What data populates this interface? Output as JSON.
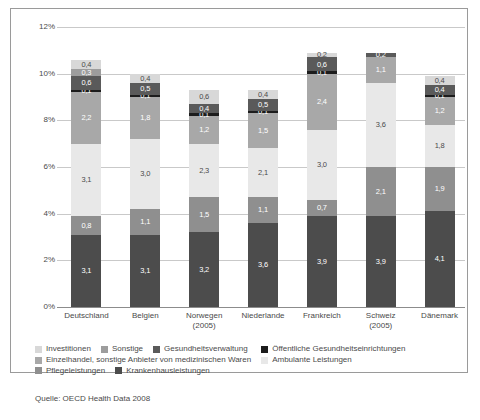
{
  "chart_data": {
    "type": "bar",
    "subtype": "stacked-bar",
    "title": "",
    "xlabel": "",
    "ylabel": "",
    "ylim": [
      0,
      12
    ],
    "ytick_labels": [
      "0%",
      "2%",
      "4%",
      "6%",
      "8%",
      "10%",
      "12%"
    ],
    "ytick_values": [
      0,
      2,
      4,
      6,
      8,
      10,
      12
    ],
    "grid": true,
    "legend_position": "bottom",
    "value_format": "comma-decimal",
    "categories": [
      "Deutschland",
      "Belgien",
      "Norwegen",
      "Niederlande",
      "Frankreich",
      "Schweiz",
      "Dänemark"
    ],
    "category_sublabels": [
      "",
      "",
      "(2005)",
      "",
      "",
      "(2005)",
      ""
    ],
    "series": [
      {
        "name": "Krankenhausleistungen",
        "color": "#4c4c4c",
        "values": [
          3.1,
          3.1,
          3.2,
          3.6,
          3.9,
          3.9,
          4.1
        ],
        "labels": [
          "3,1",
          "3,1",
          "3,2",
          "3,6",
          "3,9",
          "3,9",
          "4,1"
        ],
        "label_color": "#ffffff"
      },
      {
        "name": "Pflegeleistungen",
        "color": "#8f8f8f",
        "values": [
          0.8,
          1.1,
          1.5,
          1.1,
          0.7,
          2.1,
          1.9
        ],
        "labels": [
          "0,8",
          "1,1",
          "1,5",
          "1,1",
          "0,7",
          "2,1",
          "1,9"
        ],
        "label_color": "#ffffff"
      },
      {
        "name": "Ambulante Leistungen",
        "color": "#e8e8e8",
        "values": [
          3.1,
          3.0,
          2.3,
          2.1,
          3.0,
          3.6,
          1.8
        ],
        "labels": [
          "3,1",
          "3,0",
          "2,3",
          "2,1",
          "3,0",
          "3,6",
          "1,8"
        ],
        "label_color": "#4a4a4a"
      },
      {
        "name": "Einzelhandel, sonstige Anbieter von medizinischen Waren",
        "color": "#a8a8a8",
        "values": [
          2.2,
          1.8,
          1.2,
          1.5,
          2.4,
          1.1,
          1.2
        ],
        "labels": [
          "2,2",
          "1,8",
          "1,2",
          "1,5",
          "2,4",
          "1,1",
          "1,2"
        ],
        "label_color": "#ffffff"
      },
      {
        "name": "Öffentliche Gesundheitseinrichtungen",
        "color": "#1c1c1c",
        "values": [
          0.1,
          0.1,
          0.1,
          0.1,
          0.1,
          0.0,
          0.1
        ],
        "labels": [
          "0,1",
          "0,1",
          "0,1",
          "0,1",
          "0,1",
          "",
          "0,1"
        ],
        "label_color": "#ffffff"
      },
      {
        "name": "Gesundheitsverwaltung",
        "color": "#5a5a5a",
        "values": [
          0.6,
          0.5,
          0.4,
          0.5,
          0.6,
          0.2,
          0.4
        ],
        "labels": [
          "0,6",
          "0,5",
          "0,4",
          "0,5",
          "0,6",
          "0,2",
          "0,4"
        ],
        "label_color": "#ffffff"
      },
      {
        "name": "Sonstige",
        "color": "#9d9d9d",
        "values": [
          0.3,
          0.0,
          0.0,
          0.0,
          0.0,
          0.0,
          0.0
        ],
        "labels": [
          "0,3",
          "",
          "",
          "",
          "",
          "",
          ""
        ],
        "label_color": "#ffffff"
      },
      {
        "name": "Investitionen",
        "color": "#d8d8d8",
        "values": [
          0.4,
          0.4,
          0.6,
          0.4,
          0.2,
          0.0,
          0.4
        ],
        "labels": [
          "0,4",
          "0,4",
          "0,6",
          "0,4",
          "0,2",
          "",
          "0,4"
        ],
        "label_color": "#4a4a4a"
      }
    ],
    "totals": [
      10.6,
      10.0,
      9.3,
      9.3,
      10.9,
      11.4,
      9.9
    ]
  },
  "legend": {
    "items": [
      {
        "label": "Investitionen",
        "color": "#d8d8d8"
      },
      {
        "label": "Sonstige",
        "color": "#9d9d9d"
      },
      {
        "label": "Gesundheitsverwaltung",
        "color": "#5a5a5a"
      },
      {
        "label": "Öffentliche Gesundheitseinrichtungen",
        "color": "#1c1c1c"
      },
      {
        "label": "Einzelhandel, sonstige Anbieter von medizinischen Waren",
        "color": "#a8a8a8"
      },
      {
        "label": "Ambulante Leistungen",
        "color": "#e8e8e8"
      },
      {
        "label": "Pflegeleistungen",
        "color": "#8f8f8f"
      },
      {
        "label": "Krankenhausleistungen",
        "color": "#4c4c4c"
      }
    ]
  },
  "source": {
    "text": "Quelle: OECD Health Data 2008"
  }
}
